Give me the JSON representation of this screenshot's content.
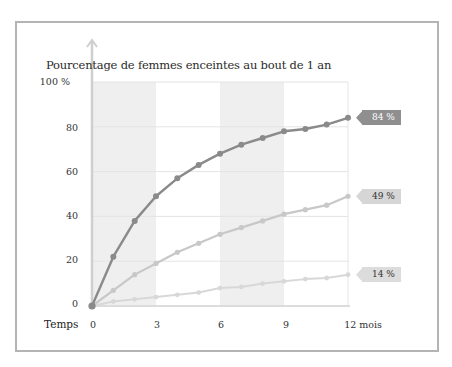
{
  "chart_data": {
    "type": "line",
    "title": "Pourcentage de femmes enceintes au bout de 1 an",
    "xlabel": "Temps",
    "ylabel": "",
    "x": [
      0,
      1,
      2,
      3,
      4,
      5,
      6,
      7,
      8,
      9,
      10,
      11,
      12
    ],
    "x_tick_labels": [
      "0",
      "3",
      "6",
      "9",
      "12 mois"
    ],
    "y_tick_labels": [
      "100 %",
      "80",
      "60",
      "40",
      "20",
      "0"
    ],
    "ylim": [
      0,
      100
    ],
    "xlim": [
      0,
      12
    ],
    "grid": true,
    "shaded_bands": [
      [
        0,
        3
      ],
      [
        6,
        9
      ]
    ],
    "series": [
      {
        "name": "Série 1 (foncée)",
        "color": "#8a8a8a",
        "values": [
          0,
          22,
          38,
          49,
          57,
          63,
          68,
          72,
          75,
          78,
          79,
          81,
          84
        ],
        "end_label": "84 %"
      },
      {
        "name": "Série 2 (moyenne)",
        "color": "#c8c8c8",
        "values": [
          0,
          7,
          14,
          19,
          24,
          28,
          32,
          35,
          38,
          41,
          43,
          45,
          49
        ],
        "end_label": "49 %"
      },
      {
        "name": "Série 3 (claire)",
        "color": "#d8d8d8",
        "values": [
          0,
          2,
          3,
          4,
          5,
          6,
          8,
          8.5,
          10,
          11,
          12,
          12.5,
          14
        ],
        "end_label": "14 %"
      }
    ]
  }
}
